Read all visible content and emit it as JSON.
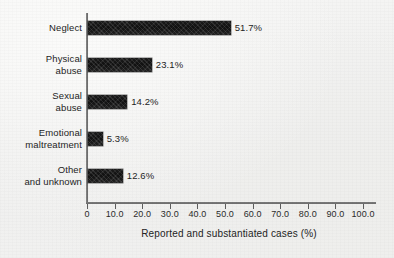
{
  "chart_data": {
    "type": "bar",
    "orientation": "horizontal",
    "title": "",
    "xlabel": "Reported and substantiated cases (%)",
    "ylabel": "",
    "categories": [
      "Neglect",
      "Physical\nabuse",
      "Sexual\nabuse",
      "Emotional\nmaltreatment",
      "Other\nand unknown"
    ],
    "values": [
      51.7,
      23.1,
      14.2,
      5.3,
      12.6
    ],
    "value_labels": [
      "51.7%",
      "23.1%",
      "14.2%",
      "5.3%",
      "12.6%"
    ],
    "xlim": [
      0,
      100
    ],
    "xticks": [
      0,
      10,
      20,
      30,
      40,
      50,
      60,
      70,
      80,
      90,
      100
    ],
    "xtick_labels": [
      "0",
      "10.0",
      "20.0",
      "30.0",
      "40.0",
      "50.0",
      "60.0",
      "70.0",
      "80.0",
      "90.0",
      "100.0"
    ],
    "grid": false,
    "legend": false,
    "legend_position": "none",
    "bar_color": "#151515",
    "axis_color": "#5d5d5d",
    "background_color": "#f2f2f1",
    "text_color": "#242424"
  }
}
